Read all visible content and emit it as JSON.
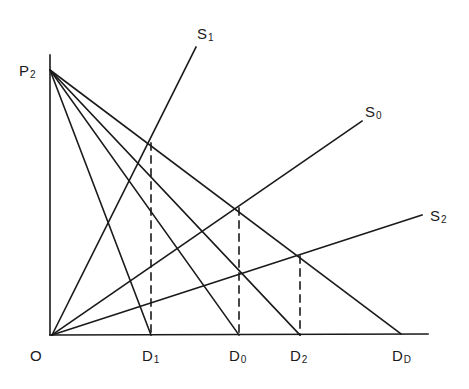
{
  "diagram": {
    "type": "supply-demand-diagram",
    "colors": {
      "line": "#1a1a1a",
      "background": "#ffffff"
    },
    "axes": {
      "origin_label": "O",
      "origin": [
        52,
        335
      ],
      "y_axis_top": [
        50,
        55
      ],
      "x_axis_end": [
        428,
        334
      ]
    },
    "price_point": {
      "label": "P",
      "sub": "2",
      "point": [
        50,
        70
      ]
    },
    "demand_lines": [
      {
        "id": "D1",
        "label": "D",
        "sub": "1",
        "from": [
          50,
          70
        ],
        "to": [
          151,
          335
        ]
      },
      {
        "id": "D0",
        "label": "D",
        "sub": "0",
        "from": [
          50,
          70
        ],
        "to": [
          239,
          335
        ]
      },
      {
        "id": "D2",
        "label": "D",
        "sub": "2",
        "from": [
          50,
          70
        ],
        "to": [
          300,
          335
        ]
      },
      {
        "id": "DD",
        "label": "D",
        "sub": "D",
        "from": [
          50,
          70
        ],
        "to": [
          401,
          334
        ]
      }
    ],
    "supply_lines": [
      {
        "id": "S1",
        "label": "S",
        "sub": "1",
        "from": [
          52,
          335
        ],
        "to": [
          196,
          47
        ]
      },
      {
        "id": "S0",
        "label": "S",
        "sub": "0",
        "from": [
          52,
          335
        ],
        "to": [
          362,
          121
        ]
      },
      {
        "id": "S2",
        "label": "S",
        "sub": "2",
        "from": [
          52,
          335
        ],
        "to": [
          422,
          215
        ]
      }
    ],
    "dashed_lines": [
      {
        "id": "dash-D1",
        "from": [
          151,
          143
        ],
        "to": [
          151,
          335
        ]
      },
      {
        "id": "dash-D0",
        "from": [
          239,
          208
        ],
        "to": [
          239,
          335
        ]
      },
      {
        "id": "dash-D2",
        "from": [
          300,
          256
        ],
        "to": [
          300,
          335
        ]
      }
    ],
    "labels": {
      "P2": {
        "main": "P",
        "sub": "2"
      },
      "O": {
        "main": "O"
      },
      "D1": {
        "main": "D",
        "sub": "1"
      },
      "D0": {
        "main": "D",
        "sub": "0"
      },
      "D2": {
        "main": "D",
        "sub": "2"
      },
      "DD": {
        "main": "D",
        "sub": "D"
      },
      "S1": {
        "main": "S",
        "sub": "1"
      },
      "S0": {
        "main": "S",
        "sub": "0"
      },
      "S2": {
        "main": "S",
        "sub": "2"
      }
    }
  }
}
